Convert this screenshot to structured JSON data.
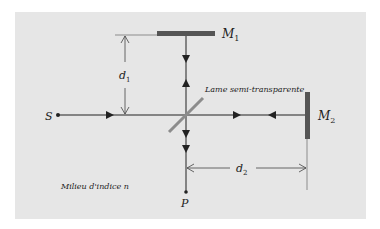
{
  "diagram": {
    "type": "Michelson interferometer",
    "labels": {
      "source": "S",
      "mirror1": "M",
      "mirror1_sub": "1",
      "mirror2": "M",
      "mirror2_sub": "2",
      "distance1": "d",
      "distance1_sub": "1",
      "distance2": "d",
      "distance2_sub": "2",
      "beamsplitter": "Lame semi-transparente",
      "point": "P",
      "medium": "Milieu d'indice n"
    },
    "colors": {
      "background": "#e6e6e6",
      "mirror": "#555555",
      "beamsplitter": "#8c8c8c",
      "beam": "#222222"
    }
  }
}
